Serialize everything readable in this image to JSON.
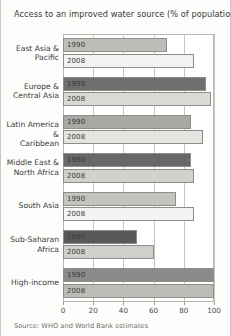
{
  "chart_data": {
    "type": "bar",
    "orientation": "horizontal",
    "title": "Access to an improved water source (% of population)",
    "xlabel": "",
    "ylabel": "",
    "xlim": [
      0,
      100
    ],
    "xticks": [
      0,
      20,
      40,
      60,
      80,
      100
    ],
    "grid": true,
    "legend": "none",
    "series_names": [
      "1990",
      "2008"
    ],
    "categories": [
      "East Asia &\nPacific",
      "Europe &\nCentral Asia",
      "Latin America &\nCaribbean",
      "Middle East &\nNorth Africa",
      "South Asia",
      "Sub-Saharan\nAfrica",
      "High-income"
    ],
    "series": [
      {
        "name": "1990",
        "values": [
          69,
          95,
          85,
          85,
          75,
          49,
          100
        ]
      },
      {
        "name": "2008",
        "values": [
          87,
          98,
          93,
          87,
          87,
          60,
          100
        ]
      }
    ],
    "bar_colors_1990": [
      "#bdbdba",
      "#6f6f6d",
      "#a8a8a5",
      "#686866",
      "#c3c3c0",
      "#59595a",
      "#8a8a88"
    ],
    "bar_colors_2008": [
      "#f2f2f0",
      "#d9d9d6",
      "#e4e4e1",
      "#d0d0cd",
      "#f4f4f2",
      "#cfcfcc",
      "#bcbcb9"
    ],
    "source": "Source: WHO and World Bank estimates"
  }
}
